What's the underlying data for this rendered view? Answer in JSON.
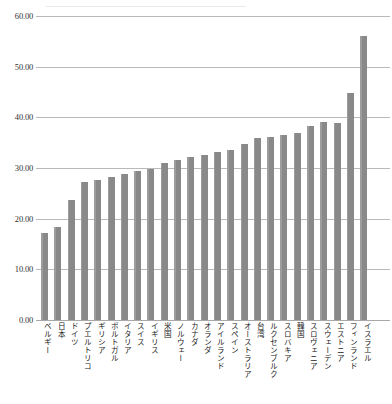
{
  "chart_data": {
    "type": "bar",
    "title": "",
    "subtitle": "",
    "xlabel": "",
    "ylabel": "",
    "ylim": [
      0,
      60
    ],
    "yticks": [
      "0.00",
      "10.00",
      "20.00",
      "30.00",
      "40.00",
      "50.00",
      "60.00"
    ],
    "ytick_values": [
      0,
      10,
      20,
      30,
      40,
      50,
      60
    ],
    "grid": true,
    "legend": "none",
    "bar_color": "#898989",
    "categories": [
      "ベルギー",
      "日本",
      "ドイツ",
      "プエルトリコ",
      "ギリシア",
      "ポルトガル",
      "イタリア",
      "スイス",
      "イギリス",
      "米国",
      "ノルウェー",
      "カナダ",
      "オランダ",
      "アイルランド",
      "スペイン",
      "オーストラリア",
      "台湾",
      "ルクセンブルク",
      "スロバキア",
      "韓国",
      "スロヴェニア",
      "スウェーデン",
      "エストニア",
      "フィンランド",
      "イスラエル"
    ],
    "values": [
      17.2,
      18.4,
      23.6,
      27.2,
      27.7,
      28.3,
      28.8,
      29.5,
      29.9,
      31.0,
      31.5,
      32.1,
      32.5,
      33.2,
      33.6,
      34.8,
      36.0,
      36.2,
      36.6,
      37.0,
      38.2,
      39.0,
      38.9,
      44.8,
      56.0
    ]
  }
}
